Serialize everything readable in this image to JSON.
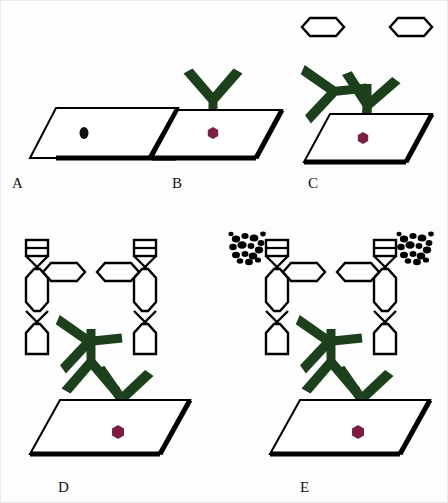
{
  "figure": {
    "background_color": "#fdfdfd",
    "panel_count": 5
  },
  "colors": {
    "antibody_green": "#1c401c",
    "antigen_maroon": "#7d1f45",
    "outline_black": "#000000",
    "plate_fill": "#ffffff",
    "dendrimer_fill": "#ffffff",
    "precipitate_black": "#000000",
    "background": "#fdfdfd"
  },
  "panels": [
    {
      "id": "A",
      "label": "A",
      "label_x": 12,
      "label_y": 188,
      "plate": {
        "x": 30,
        "y": 108,
        "w": 120,
        "h": 50,
        "skew": 22
      },
      "description": "bare substrate with immobilized analyte spot",
      "elements": [
        "substrate-plate",
        "analyte-dot-black"
      ],
      "analyte_dot": {
        "cx": 78,
        "cy": 133,
        "rx": 4.5,
        "ry": 6,
        "color": "#111111",
        "shape": "ellipse"
      },
      "has_primary_antibody": false,
      "has_secondary_antibody": false,
      "has_dendrimer": false,
      "has_precipitate": false
    },
    {
      "id": "B",
      "label": "B",
      "label_x": 172,
      "label_y": 188,
      "plate": {
        "x": 170,
        "y": 108,
        "w": 104,
        "h": 50,
        "skew": 22
      },
      "description": "capture antibody bound to analyte on substrate",
      "elements": [
        "substrate-plate",
        "analyte-hexagon-maroon",
        "primary-antibody"
      ],
      "analyte_dot": {
        "cx": 213,
        "cy": 133,
        "r": 6,
        "color": "#7d1f45",
        "shape": "hexagon"
      },
      "has_primary_antibody": true,
      "has_secondary_antibody": false,
      "has_dendrimer": false,
      "has_precipitate": false
    },
    {
      "id": "C",
      "label": "C",
      "label_x": 308,
      "label_y": 188,
      "plate": {
        "x": 305,
        "y": 112,
        "w": 110,
        "h": 50,
        "skew": 22
      },
      "description": "detection antibody bound, bearing two hexagon linker units",
      "elements": [
        "substrate-plate",
        "analyte-hexagon-maroon",
        "primary-antibody",
        "secondary-antibody",
        "hexagon-linker-left",
        "hexagon-linker-right"
      ],
      "analyte_dot": {
        "cx": 363,
        "cy": 138,
        "r": 6,
        "color": "#7d1f45",
        "shape": "hexagon"
      },
      "has_primary_antibody": true,
      "has_secondary_antibody": true,
      "has_dendrimer": false,
      "has_precipitate": false
    },
    {
      "id": "D",
      "label": "D",
      "label_x": 58,
      "label_y": 492,
      "plate": {
        "x": 52,
        "y": 398,
        "w": 128,
        "h": 56,
        "skew": 24
      },
      "description": "DNA dendrimer branches assembled onto the hexagon linkers",
      "elements": [
        "substrate-plate",
        "analyte-hexagon-maroon",
        "primary-antibody",
        "secondary-antibody",
        "hexagon-linker-left",
        "hexagon-linker-right",
        "dendrimer-chain-left",
        "dendrimer-chain-right"
      ],
      "analyte_dot": {
        "cx": 118,
        "cy": 432,
        "r": 7,
        "color": "#7d1f45",
        "shape": "hexagon"
      },
      "has_primary_antibody": true,
      "has_secondary_antibody": true,
      "has_dendrimer": true,
      "has_precipitate": false
    },
    {
      "id": "E",
      "label": "E",
      "label_x": 300,
      "label_y": 492,
      "plate": {
        "x": 292,
        "y": 398,
        "w": 128,
        "h": 56,
        "skew": 24
      },
      "description": "enzymatic precipitate clusters deposited at dendrimer termini",
      "elements": [
        "substrate-plate",
        "analyte-hexagon-maroon",
        "primary-antibody",
        "secondary-antibody",
        "hexagon-linker-left",
        "hexagon-linker-right",
        "dendrimer-chain-left",
        "dendrimer-chain-right",
        "precipitate-cluster-left",
        "precipitate-cluster-right"
      ],
      "analyte_dot": {
        "cx": 358,
        "cy": 432,
        "r": 7,
        "color": "#7d1f45",
        "shape": "hexagon"
      },
      "has_primary_antibody": true,
      "has_secondary_antibody": true,
      "has_dendrimer": true,
      "has_precipitate": true
    }
  ],
  "legend_semantics": {
    "substrate-plate": "tilted solid support surface (parallelogram)",
    "analyte-dot-black": "target analyte, unlabelled",
    "analyte-hexagon-maroon": "target analyte captured on surface",
    "primary-antibody": "Y-shaped capture antibody, dark green",
    "secondary-antibody": "rotated Y-shaped detection antibody, dark green",
    "hexagon-linker": "white open hexagon oligonucleotide linker",
    "dendrimer-chain": "vertical branched DNA dendrimer ladder",
    "precipitate-cluster": "black speckled enzymatic precipitate"
  }
}
